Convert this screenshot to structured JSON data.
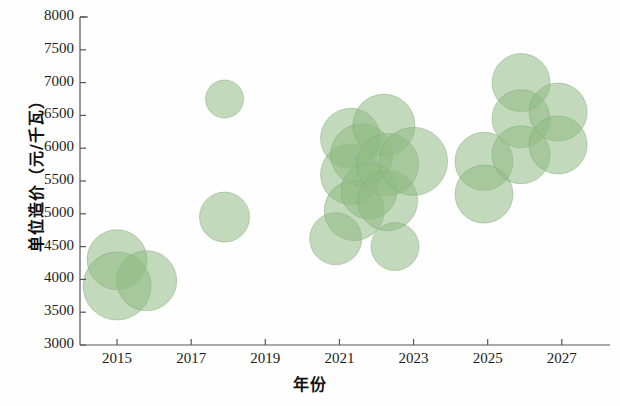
{
  "chart_data": {
    "type": "scatter",
    "subtype": "bubble",
    "title": "",
    "xlabel": "年份",
    "ylabel": "单位造价（元/千瓦）",
    "xlim": [
      2014.0,
      2028.3
    ],
    "ylim": [
      3000,
      8000
    ],
    "grid": false,
    "legend": null,
    "x_ticks": [
      2015,
      2017,
      2019,
      2021,
      2023,
      2025,
      2027
    ],
    "x_tick_labels": [
      "2015",
      "2017",
      "2019",
      "2021",
      "2023",
      "2025",
      "2027"
    ],
    "y_ticks": [
      3000,
      3500,
      4000,
      4500,
      5000,
      5500,
      6000,
      6500,
      7000,
      7500,
      8000
    ],
    "y_tick_labels": [
      "3000",
      "3500",
      "4000",
      "4500",
      "5000",
      "5500",
      "6000",
      "6500",
      "7000",
      "7500",
      "8000"
    ],
    "bubble_color": "#8fba84",
    "bubble_opacity": 0.55,
    "bubble_edge_color": "#7aa870",
    "axis_color": "#555555",
    "points": [
      {
        "x": 2015.0,
        "y": 4300,
        "r": 30
      },
      {
        "x": 2015.0,
        "y": 3900,
        "r": 34
      },
      {
        "x": 2015.8,
        "y": 3980,
        "r": 30
      },
      {
        "x": 2017.9,
        "y": 6750,
        "r": 19
      },
      {
        "x": 2017.9,
        "y": 4950,
        "r": 25
      },
      {
        "x": 2020.9,
        "y": 4620,
        "r": 26
      },
      {
        "x": 2021.3,
        "y": 6150,
        "r": 30
      },
      {
        "x": 2021.3,
        "y": 5600,
        "r": 30
      },
      {
        "x": 2021.4,
        "y": 5050,
        "r": 30
      },
      {
        "x": 2021.6,
        "y": 5900,
        "r": 31
      },
      {
        "x": 2021.8,
        "y": 5350,
        "r": 28
      },
      {
        "x": 2022.2,
        "y": 6350,
        "r": 31
      },
      {
        "x": 2022.3,
        "y": 5750,
        "r": 31
      },
      {
        "x": 2022.3,
        "y": 5200,
        "r": 30
      },
      {
        "x": 2022.5,
        "y": 4500,
        "r": 24
      },
      {
        "x": 2023.0,
        "y": 5800,
        "r": 34
      },
      {
        "x": 2024.9,
        "y": 5800,
        "r": 29
      },
      {
        "x": 2024.9,
        "y": 5300,
        "r": 29
      },
      {
        "x": 2025.9,
        "y": 7000,
        "r": 29
      },
      {
        "x": 2025.9,
        "y": 6450,
        "r": 29
      },
      {
        "x": 2025.9,
        "y": 5900,
        "r": 29
      },
      {
        "x": 2026.9,
        "y": 6550,
        "r": 29
      },
      {
        "x": 2026.9,
        "y": 6050,
        "r": 29
      }
    ]
  }
}
